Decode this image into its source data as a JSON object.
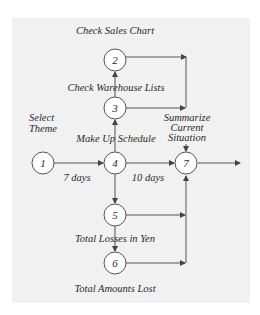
{
  "colors": {
    "panel_bg": "#f1f1f1",
    "line": "#555555",
    "node_fill": "#ffffff",
    "text": "#2a2a2a"
  },
  "nodes": [
    {
      "id": "1",
      "label": "1"
    },
    {
      "id": "2",
      "label": "2"
    },
    {
      "id": "3",
      "label": "3"
    },
    {
      "id": "4",
      "label": "4"
    },
    {
      "id": "5",
      "label": "5"
    },
    {
      "id": "6",
      "label": "6"
    },
    {
      "id": "7",
      "label": "7"
    }
  ],
  "labels": {
    "check_sales_chart": "Check Sales Chart",
    "check_warehouse_lists": "Check Warehouse Lists",
    "select_theme_line1": "Select",
    "select_theme_line2": "Theme",
    "make_up_schedule": "Make Up Schedule",
    "summarize_line1": "Summarize",
    "summarize_line2": "Current",
    "summarize_line3": "Situation",
    "seven_days": "7 days",
    "ten_days": "10 days",
    "total_losses_in_yen": "Total Losses in Yen",
    "total_amounts_lost": "Total Amounts Lost"
  },
  "edges": [
    {
      "from": "1",
      "to": "4",
      "label": "7 days"
    },
    {
      "from": "4",
      "to": "7",
      "label": "10 days"
    },
    {
      "from": "4",
      "to": "3"
    },
    {
      "from": "3",
      "to": "2"
    },
    {
      "from": "2",
      "to": "7"
    },
    {
      "from": "3",
      "to": "7"
    },
    {
      "from": "4",
      "to": "5"
    },
    {
      "from": "5",
      "to": "6"
    },
    {
      "from": "5",
      "to": "7"
    },
    {
      "from": "6",
      "to": "7"
    },
    {
      "from": "7",
      "to": "output"
    }
  ]
}
